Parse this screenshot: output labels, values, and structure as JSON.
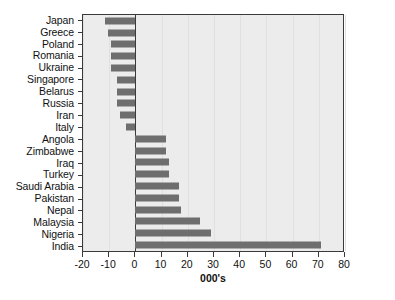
{
  "chart_data": {
    "type": "bar",
    "orientation": "horizontal",
    "title": "",
    "xlabel": "000's",
    "ylabel": "",
    "xlim": [
      -20,
      80
    ],
    "xticks": [
      -20,
      -10,
      0,
      10,
      20,
      30,
      40,
      50,
      60,
      70,
      80
    ],
    "xticklabels": [
      "-20",
      "-10",
      "0",
      "10",
      "20",
      "30",
      "40",
      "50",
      "60",
      "70",
      "80"
    ],
    "grid": true,
    "legend": false,
    "bar_color": "#6e6e6e",
    "plot_background": "#ececed",
    "axis_color": "#3a3a3a",
    "categories": [
      "Japan",
      "Greece",
      "Poland",
      "Romania",
      "Ukraine",
      "Singapore",
      "Belarus",
      "Russia",
      "Iran",
      "Italy",
      "Angola",
      "Zimbabwe",
      "Iraq",
      "Turkey",
      "Saudi Arabia",
      "Pakistan",
      "Nepal",
      "Malaysia",
      "Nigeria",
      "India"
    ],
    "values": [
      -11.5,
      -10.5,
      -9.5,
      -9.5,
      -9.5,
      -7.0,
      -7.0,
      -7.0,
      -6.0,
      -3.5,
      11.5,
      11.5,
      13.0,
      13.0,
      16.5,
      16.5,
      17.5,
      24.5,
      29.0,
      71.0
    ]
  }
}
